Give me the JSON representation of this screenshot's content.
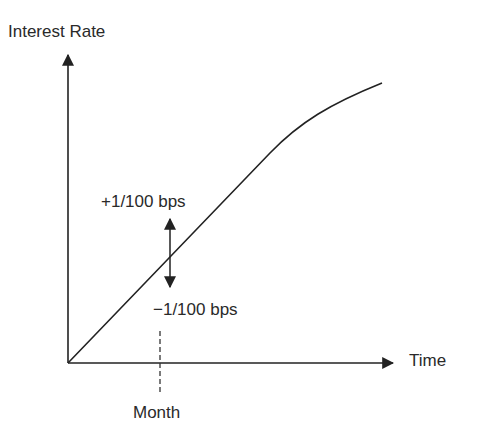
{
  "diagram": {
    "y_axis": {
      "label": "Interest Rate",
      "icon": "arrow-up-icon"
    },
    "x_axis": {
      "label": "Time",
      "icon": "arrow-right-icon"
    },
    "curve": {
      "description": "Interest rate curve rising from origin, concave toward the end"
    },
    "shift_arrow": {
      "icon": "double-arrow-vertical-icon",
      "upper_label": "+1/100 bps",
      "lower_label": "−1/100 bps"
    },
    "tick": {
      "label": "Month",
      "style": "dashed"
    },
    "colors": {
      "line": "#222222",
      "background": "#ffffff"
    }
  }
}
